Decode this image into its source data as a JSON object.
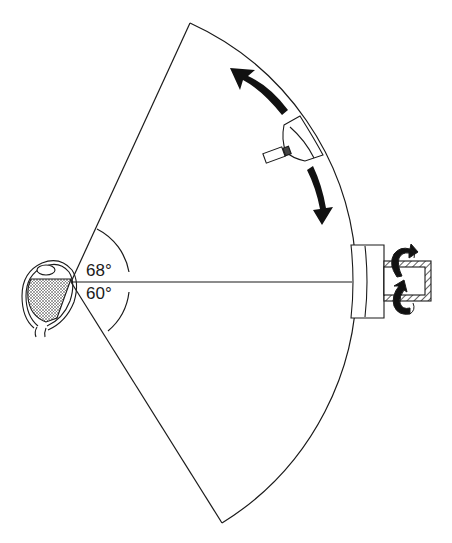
{
  "diagram": {
    "type": "perimetry visual field sector",
    "labels": {
      "upper_angle": "68°",
      "lower_angle": "60°"
    },
    "elements": [
      {
        "name": "eye",
        "description": "cross-section of eye with shaded vitreous"
      },
      {
        "name": "visual-field-sector",
        "description": "circular sector from eye spanning 68° upward and 60° downward"
      },
      {
        "name": "fixation-axis",
        "description": "horizontal line from eye to fixation target"
      },
      {
        "name": "angle-arc",
        "description": "small arc marking field angles"
      },
      {
        "name": "moving-stimulus-lamp",
        "description": "stimulus projector on arc with movement arrows"
      },
      {
        "name": "move-up-arrow",
        "description": "curved black arrow pointing upward along arc"
      },
      {
        "name": "move-down-arrow",
        "description": "curved black arrow pointing downward along arc"
      },
      {
        "name": "fixation-block",
        "description": "block at end of fixation axis on arc"
      },
      {
        "name": "rotation-shaft",
        "description": "hatched tubular shaft with rotation arrows"
      }
    ],
    "colors": {
      "line": "#1a1a1a",
      "background": "#ffffff"
    }
  }
}
